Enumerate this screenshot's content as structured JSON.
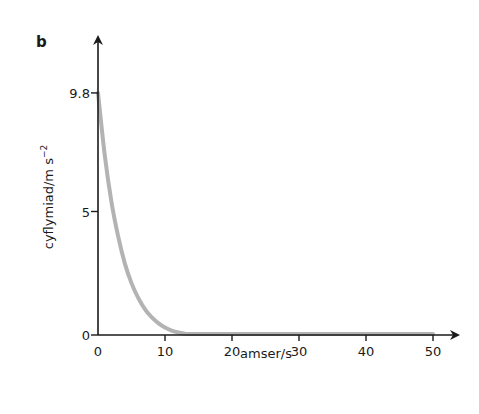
{
  "chart_data": {
    "type": "line",
    "panel_label": "b",
    "title": "",
    "xlabel": "amser/s",
    "ylabel": "cyflymiad/m s",
    "ylabel_superscript": "−2",
    "xlim": [
      0,
      53
    ],
    "ylim": [
      0,
      11.5
    ],
    "x_ticks": [
      0,
      10,
      20,
      30,
      40,
      50
    ],
    "x_tick_labels": [
      "0",
      "10",
      "20",
      "30",
      "40",
      "50"
    ],
    "y_ticks": [
      0,
      5,
      9.8
    ],
    "y_tick_labels": [
      "0",
      "5",
      "9.8"
    ],
    "grid": false,
    "legend": null,
    "series": [
      {
        "name": "acceleration",
        "color": "#b3b3b3",
        "x": [
          0,
          1,
          2,
          3,
          4,
          5,
          6,
          7,
          8,
          9,
          10,
          11,
          12,
          13,
          14,
          15,
          20,
          30,
          40,
          50
        ],
        "y": [
          9.8,
          7.3,
          5.4,
          4.0,
          2.9,
          2.1,
          1.5,
          1.05,
          0.72,
          0.48,
          0.3,
          0.18,
          0.1,
          0.05,
          0.02,
          0.01,
          0.0,
          0.0,
          0.0,
          0.0
        ]
      }
    ]
  },
  "axis_color": "#1a1a1a"
}
